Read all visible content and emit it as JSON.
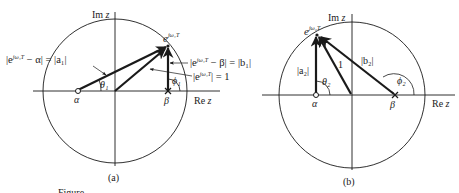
{
  "figure": {
    "caption_fragment": "Figure",
    "panels": [
      {
        "id": "a",
        "label": "(a)",
        "axis_real": "Re z",
        "axis_imag": "Im z",
        "unit_circle": true,
        "points": {
          "zero": {
            "symbol": "α",
            "marker": "open-circle"
          },
          "pole": {
            "symbol": "β",
            "marker": "cross"
          },
          "point_on_circle": {
            "base": "e",
            "superscript": "jω₁T"
          }
        },
        "vectors": [
          {
            "from": "α",
            "to": "e^{jω₁T}",
            "label": "|e^{jω₁T} − α| = |a₁|",
            "angle": "θ₁"
          },
          {
            "from": "origin",
            "to": "e^{jω₁T}",
            "label": "|e^{jω₁T}| = 1"
          },
          {
            "from": "β",
            "to": "e^{jω₁T}",
            "label": "|e^{jω₁T} − β| = |b₁|",
            "angle": "ϕ₁"
          }
        ],
        "labels": {
          "a1_lhs_base": "|e",
          "a1_lhs_sup": "jω₁T",
          "a1_lhs_rest": " − α| = |a₁|",
          "b1_base": "|e",
          "b1_sup": "jω₁T",
          "b1_rest": " − β| = |b₁|",
          "unit_base": "|e",
          "unit_sup": "jω₁T",
          "unit_rest": "| = 1",
          "theta": "θ₁",
          "phi": "ϕ₁",
          "alpha": "α",
          "beta": "β",
          "e_base": "e",
          "e_sup": "jω₁T"
        }
      },
      {
        "id": "b",
        "label": "(b)",
        "axis_real": "Re z",
        "axis_imag": "Im z",
        "unit_circle": true,
        "points": {
          "zero": {
            "symbol": "α",
            "marker": "open-circle"
          },
          "pole": {
            "symbol": "β",
            "marker": "cross"
          },
          "point_on_circle": {
            "base": "e",
            "superscript": "jω₂T"
          }
        },
        "vectors": [
          {
            "from": "α",
            "to": "e^{jω₂T}",
            "label": "|a₂|",
            "angle": "θ₂"
          },
          {
            "from": "origin",
            "to": "e^{jω₂T}",
            "label": "1"
          },
          {
            "from": "β",
            "to": "e^{jω₂T}",
            "label": "|b₂|",
            "angle": "ϕ₂"
          }
        ],
        "labels": {
          "a2": "|a₂|",
          "b2": "|b₂|",
          "one": "1",
          "theta": "θ₂",
          "phi": "ϕ₂",
          "alpha": "α",
          "beta": "β",
          "e_base": "e",
          "e_sup": "jω₂T"
        }
      }
    ]
  }
}
